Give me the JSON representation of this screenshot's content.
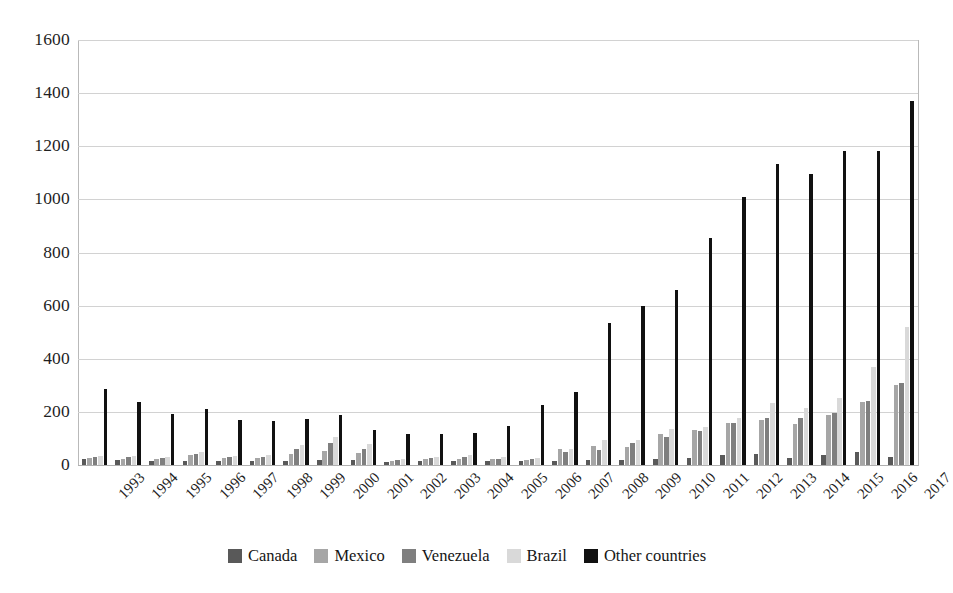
{
  "chart_data": {
    "type": "bar",
    "title": "",
    "subtitle": "",
    "xlabel": "",
    "ylabel": "",
    "ylim": [
      0,
      1600
    ],
    "ytick_values": [
      0,
      200,
      400,
      600,
      800,
      1000,
      1200,
      1400,
      1600
    ],
    "ytick_labels": [
      "0",
      "200",
      "400",
      "600",
      "800",
      "1000",
      "1200",
      "1400",
      "1600"
    ],
    "grid": true,
    "grid_axis": "y",
    "legend_position": "bottom",
    "categories": [
      "1993",
      "1994",
      "1995",
      "1996",
      "1997",
      "1998",
      "1999",
      "2000",
      "2001",
      "2002",
      "2003",
      "2004",
      "2005",
      "2006",
      "2007",
      "2008",
      "2009",
      "2010",
      "2011",
      "2012",
      "2013",
      "2014",
      "2015",
      "2016",
      "2017"
    ],
    "series": [
      {
        "name": "Canada",
        "color": "#595959",
        "values": [
          22,
          20,
          14,
          16,
          15,
          14,
          16,
          20,
          18,
          10,
          14,
          14,
          14,
          14,
          16,
          18,
          20,
          22,
          26,
          36,
          40,
          26,
          38,
          50,
          30
        ]
      },
      {
        "name": "Mexico",
        "color": "#a6a6a6",
        "values": [
          26,
          24,
          22,
          36,
          28,
          26,
          40,
          52,
          44,
          16,
          22,
          24,
          22,
          20,
          62,
          70,
          68,
          116,
          132,
          160,
          168,
          154,
          190,
          236,
          300
        ]
      },
      {
        "name": "Venezuela",
        "color": "#7f7f7f",
        "values": [
          30,
          30,
          26,
          40,
          30,
          30,
          60,
          82,
          60,
          18,
          26,
          30,
          24,
          24,
          48,
          58,
          82,
          104,
          128,
          160,
          176,
          176,
          196,
          240,
          310
        ]
      },
      {
        "name": "Brazil",
        "color": "#d9d9d9",
        "values": [
          34,
          34,
          30,
          48,
          34,
          36,
          76,
          104,
          78,
          22,
          32,
          36,
          30,
          28,
          60,
          96,
          96,
          134,
          142,
          176,
          232,
          214,
          252,
          368,
          520
        ]
      },
      {
        "name": "Other countries",
        "color": "#111111",
        "values": [
          285,
          238,
          193,
          210,
          170,
          165,
          175,
          190,
          133,
          118,
          116,
          122,
          148,
          225,
          276,
          535,
          600,
          660,
          855,
          1008,
          1133,
          1097,
          1183,
          1181,
          1370
        ]
      }
    ]
  },
  "legend": {
    "items": [
      {
        "label": "Canada",
        "color": "#595959"
      },
      {
        "label": "Mexico",
        "color": "#a6a6a6"
      },
      {
        "label": "Venezuela",
        "color": "#7f7f7f"
      },
      {
        "label": "Brazil",
        "color": "#d9d9d9"
      },
      {
        "label": "Other countries",
        "color": "#111111"
      }
    ]
  },
  "style": {
    "background": "#ffffff",
    "gridline_color": "#d2d2d2",
    "axis_color": "#b9b9b9",
    "text_color": "#1f1f1f"
  }
}
